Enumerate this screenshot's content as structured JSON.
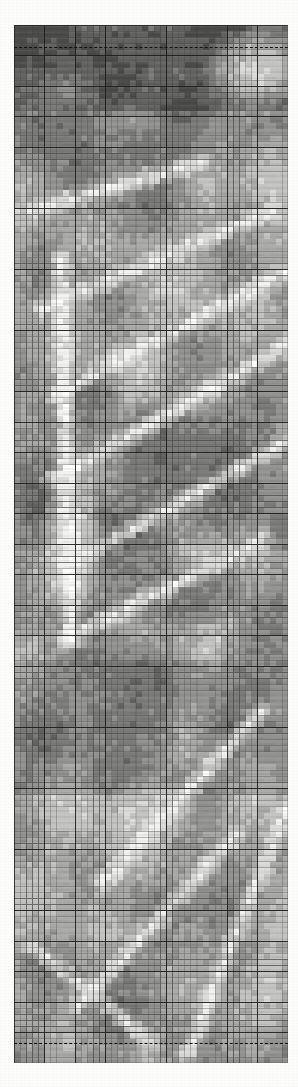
{
  "figure": {
    "type": "raster-grid-scan",
    "title": "",
    "background_color": "#fdfdfb"
  },
  "plot": {
    "left_px": 14,
    "top_px": 25,
    "width_px": 274,
    "height_px": 1038,
    "columns": 45,
    "rows": 170,
    "cell_width_px": 6.09,
    "cell_height_px": 6.11,
    "minor_gridline_color": "#5d5d5d",
    "minor_gridline_width_px": 0.75,
    "major_gridline_color": "#2a2a2a",
    "major_gridline_width_px": 1.3,
    "major_every_cols": 5,
    "major_every_rows": 5
  },
  "reference_lines": [
    {
      "name": "top-dashed-reference",
      "orientation": "horizontal",
      "y_px": 47,
      "style": "dashed",
      "color": "#14110e",
      "thickness_px": 1.6
    },
    {
      "name": "bottom-dashed-reference",
      "orientation": "horizontal",
      "y_px": 1043,
      "style": "dashed",
      "color": "#14110e",
      "thickness_px": 1.6
    }
  ],
  "palette": {
    "levels": [
      {
        "name": "level-0-white",
        "value": 0,
        "hex": "#ffffff"
      },
      {
        "name": "level-1-near-white",
        "value": 1,
        "hex": "#f3f3f1"
      },
      {
        "name": "level-2-light",
        "value": 2,
        "hex": "#dcdcda"
      },
      {
        "name": "level-3-light-mid",
        "value": 3,
        "hex": "#c4c4c2"
      },
      {
        "name": "level-4-mid",
        "value": 4,
        "hex": "#ababa9"
      },
      {
        "name": "level-5-mid-dark",
        "value": 5,
        "hex": "#949492"
      },
      {
        "name": "level-6-dark",
        "value": 6,
        "hex": "#7c7c7a"
      },
      {
        "name": "level-7-darker",
        "value": 7,
        "hex": "#646462"
      },
      {
        "name": "level-8-darkest",
        "value": 8,
        "hex": "#4c4c4a"
      }
    ]
  },
  "chart_data": {
    "type": "heatmap",
    "title": "",
    "xlabel": "",
    "ylabel": "",
    "grid": true,
    "legend": "none",
    "nx": 45,
    "ny": 170,
    "value_range": [
      0,
      8
    ],
    "note": "Cell shade levels 0 (white) to 8 (darkest). Field reconstructed as banded diagonal ridge/valley structure with bright streak lineaments.",
    "field_model": {
      "base_level": 4.6,
      "bands": [
        {
          "y_from": 0,
          "y_to": 7,
          "level": 7.0,
          "desc": "dark cap band at top"
        },
        {
          "y_from": 7,
          "y_to": 14,
          "level": 6.2,
          "desc": "dark band below cap"
        },
        {
          "y_from": 14,
          "y_to": 30,
          "level": 4.8,
          "desc": "mixed mid band"
        },
        {
          "y_from": 30,
          "y_to": 62,
          "level": 4.4,
          "desc": "mid grey with bright lineaments"
        },
        {
          "y_from": 62,
          "y_to": 86,
          "level": 5.1,
          "desc": "darker ridge body"
        },
        {
          "y_from": 86,
          "y_to": 104,
          "level": 4.2,
          "desc": "lighter trough"
        },
        {
          "y_from": 104,
          "y_to": 126,
          "level": 5.3,
          "desc": "dark diagonal wedge"
        },
        {
          "y_from": 126,
          "y_to": 150,
          "level": 4.0,
          "desc": "light speckled field"
        },
        {
          "y_from": 150,
          "y_to": 170,
          "level": 4.3,
          "desc": "lower mid band"
        }
      ],
      "bright_lineaments": [
        {
          "x0": 2,
          "y0": 30,
          "x1": 30,
          "y1": 22,
          "width": 1.2,
          "level": 0.6
        },
        {
          "x0": 4,
          "y0": 46,
          "x1": 42,
          "y1": 30,
          "width": 1.1,
          "level": 0.8
        },
        {
          "x0": 6,
          "y0": 60,
          "x1": 44,
          "y1": 40,
          "width": 1.1,
          "level": 0.9
        },
        {
          "x0": 6,
          "y0": 74,
          "x1": 44,
          "y1": 52,
          "width": 1.2,
          "level": 0.8
        },
        {
          "x0": 8,
          "y0": 88,
          "x1": 44,
          "y1": 68,
          "width": 1.0,
          "level": 1.1
        },
        {
          "x0": 8,
          "y0": 100,
          "x1": 40,
          "y1": 84,
          "width": 1.2,
          "level": 1.0
        },
        {
          "x0": 7,
          "y0": 38,
          "x1": 9,
          "y1": 100,
          "width": 1.3,
          "level": 0.5
        },
        {
          "x0": 14,
          "y0": 140,
          "x1": 40,
          "y1": 112,
          "width": 1.2,
          "level": 0.9
        },
        {
          "x0": 10,
          "y0": 160,
          "x1": 36,
          "y1": 132,
          "width": 1.1,
          "level": 1.0
        },
        {
          "x0": 28,
          "y0": 168,
          "x1": 44,
          "y1": 128,
          "width": 1.2,
          "level": 0.9
        },
        {
          "x0": 2,
          "y0": 150,
          "x1": 22,
          "y1": 166,
          "width": 1.0,
          "level": 1.2
        }
      ],
      "dark_patches": [
        {
          "cx": 8,
          "cy": 4,
          "rx": 9,
          "ry": 4,
          "level": 7.6
        },
        {
          "cx": 26,
          "cy": 3,
          "rx": 12,
          "ry": 3,
          "level": 7.2
        },
        {
          "cx": 6,
          "cy": 16,
          "rx": 6,
          "ry": 5,
          "level": 6.6
        },
        {
          "cx": 22,
          "cy": 20,
          "rx": 7,
          "ry": 4,
          "level": 6.2
        },
        {
          "cx": 30,
          "cy": 70,
          "rx": 13,
          "ry": 7,
          "level": 6.1
        },
        {
          "cx": 26,
          "cy": 92,
          "rx": 10,
          "ry": 5,
          "level": 6.0
        },
        {
          "cx": 18,
          "cy": 112,
          "rx": 7,
          "ry": 10,
          "level": 6.4
        },
        {
          "cx": 34,
          "cy": 142,
          "rx": 6,
          "ry": 6,
          "level": 5.9
        },
        {
          "cx": 40,
          "cy": 104,
          "rx": 6,
          "ry": 5,
          "level": 5.7
        },
        {
          "cx": 12,
          "cy": 60,
          "rx": 4,
          "ry": 4,
          "level": 6.0
        }
      ],
      "light_patches": [
        {
          "cx": 40,
          "cy": 6,
          "rx": 7,
          "ry": 5,
          "level": 1.6
        },
        {
          "cx": 42,
          "cy": 24,
          "rx": 5,
          "ry": 6,
          "level": 2.2
        },
        {
          "cx": 9,
          "cy": 84,
          "rx": 4,
          "ry": 9,
          "level": 1.4
        },
        {
          "cx": 30,
          "cy": 86,
          "rx": 5,
          "ry": 3,
          "level": 2.0
        },
        {
          "cx": 22,
          "cy": 128,
          "rx": 6,
          "ry": 4,
          "level": 2.4
        },
        {
          "cx": 42,
          "cy": 156,
          "rx": 5,
          "ry": 6,
          "level": 2.6
        }
      ]
    }
  }
}
